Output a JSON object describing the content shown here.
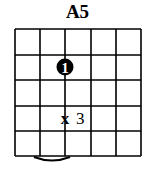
{
  "chord": {
    "name": "A5",
    "strings": 6,
    "frets": 5,
    "finger_dot": {
      "finger": "1",
      "string": 3,
      "fret": 2
    },
    "marker": {
      "symbol": "x",
      "label": "3",
      "string": 3,
      "fret": 4
    },
    "bottom_arc": {
      "from_string": 1,
      "to_string": 3
    }
  },
  "colors": {
    "line": "#000000",
    "background": "#ffffff",
    "dot": "#000000",
    "dot_text": "#ffffff"
  }
}
